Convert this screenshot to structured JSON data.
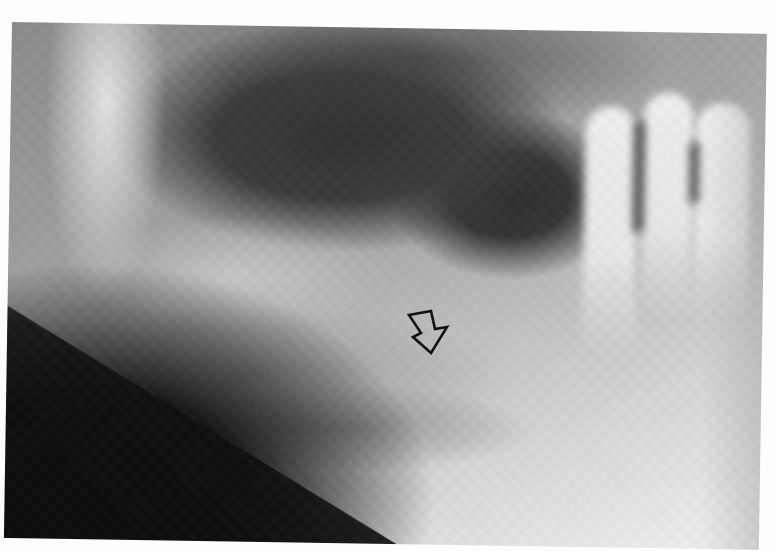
{
  "image": {
    "description": "Grayscale radiograph of a mandible (panoramic view) showing teeth on the right and a lesion indicated by an open arrow",
    "annotation": {
      "type": "open-arrow",
      "direction": "down-right",
      "stroke_color": "#111111"
    },
    "palette": {
      "paper": "#fdfdfd",
      "dark": "#0c0c0c",
      "mid": "#9a9a9a",
      "bright": "#f4f4f4"
    }
  }
}
